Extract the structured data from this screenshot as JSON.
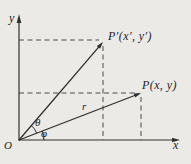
{
  "diagram": {
    "labels": {
      "y_axis": "y",
      "x_axis": "x",
      "origin": "O",
      "point_p_prime": "P′(x′, y′)",
      "point_p": "P(x, y)",
      "radius": "r",
      "angle_theta": "θ",
      "angle_phi": "φ"
    },
    "colors": {
      "background": "#ebeae7",
      "line": "#2f2f2f",
      "dashed": "#4a4a4a"
    }
  }
}
